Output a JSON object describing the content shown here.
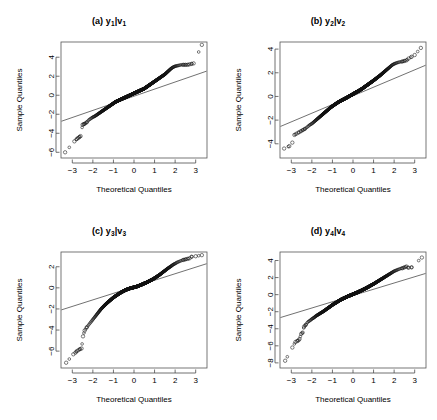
{
  "figure": {
    "width": 437,
    "height": 420,
    "background": "#ffffff",
    "layout": "2x2 grid of Q-Q (quantile-quantile) plots"
  },
  "panels": [
    {
      "id": "panel-a",
      "title": "(a) y",
      "title_sub1": "1",
      "title_mid": "|v",
      "title_sub2": "1",
      "title_full": "(a) y1|v1",
      "xlabel": "Theoretical Quantiles",
      "ylabel": "Sample Quantiles",
      "xticks": [
        -3,
        -2,
        -1,
        0,
        1,
        2,
        3
      ],
      "yticks": [
        4,
        2,
        0,
        -2,
        -4,
        -6
      ],
      "xlim": [
        -3.55,
        3.55
      ],
      "ylim": [
        -6.6,
        5.6
      ]
    },
    {
      "id": "panel-b",
      "title": "(b) y",
      "title_sub1": "2",
      "title_mid": "|v",
      "title_sub2": "2",
      "title_full": "(b) y2|v2",
      "xlabel": "Theoretical Quantiles",
      "ylabel": "Sample Quantiles",
      "xticks": [
        -3,
        -2,
        -1,
        0,
        1,
        2,
        3
      ],
      "yticks": [
        4,
        2,
        0,
        -2,
        -4
      ],
      "xlim": [
        -3.55,
        3.55
      ],
      "ylim": [
        -5.2,
        4.6
      ]
    },
    {
      "id": "panel-c",
      "title": "(c) y",
      "title_sub1": "3",
      "title_mid": "|v",
      "title_sub2": "3",
      "title_full": "(c) y3|v3",
      "xlabel": "Theoretical Quantiles",
      "ylabel": "Sample Quantiles",
      "xticks": [
        -3,
        -2,
        -1,
        0,
        1,
        2,
        3
      ],
      "yticks": [
        2,
        0,
        -2,
        -4,
        -6
      ],
      "xlim": [
        -3.55,
        3.55
      ],
      "ylim": [
        -7.6,
        3.4
      ]
    },
    {
      "id": "panel-d",
      "title": "(d) y",
      "title_sub1": "4",
      "title_mid": "|v",
      "title_sub2": "4",
      "title_full": "(d) y4|v4",
      "xlabel": "Theoretical Quantiles",
      "ylabel": "Sample Quantiles",
      "xticks": [
        -3,
        -2,
        -1,
        0,
        1,
        2,
        3
      ],
      "yticks": [
        4,
        2,
        0,
        -2,
        -4,
        -6,
        -8
      ],
      "xlim": [
        -3.55,
        3.55
      ],
      "ylim": [
        -8.6,
        5.0
      ]
    }
  ],
  "chart_data": [
    {
      "type": "scatter",
      "id": "panel-a",
      "title": "(a) y1|v1",
      "xlabel": "Theoretical Quantiles",
      "ylabel": "Sample Quantiles",
      "xlim": [
        -3.55,
        3.55
      ],
      "ylim": [
        -6.6,
        5.6
      ],
      "xticks": [
        -3,
        -2,
        -1,
        0,
        1,
        2,
        3
      ],
      "yticks": [
        4,
        2,
        0,
        -2,
        -4,
        -6
      ],
      "grid": false,
      "legend": "none",
      "annotations": [
        "reference line through 1st and 3rd quartiles"
      ],
      "reference_line": {
        "x": [
          -3.55,
          3.55
        ],
        "y": [
          -2.75,
          2.55
        ]
      },
      "series": [
        {
          "name": "sample quantiles",
          "marker": "open-circle",
          "x": [
            -3.35,
            -2.9,
            -2.78,
            -2.72,
            -2.66,
            -2.6,
            -2.5,
            -2.45,
            -2.4,
            -2.3,
            -2.2,
            -2.1,
            -2.0,
            -1.9,
            -1.8,
            -1.7,
            -1.6,
            -1.5,
            -1.4,
            -1.3,
            -1.2,
            -1.1,
            -1.0,
            -0.9,
            -0.8,
            -0.7,
            -0.6,
            -0.5,
            -0.4,
            -0.3,
            -0.2,
            -0.1,
            0.0,
            0.1,
            0.2,
            0.3,
            0.4,
            0.5,
            0.6,
            0.7,
            0.8,
            0.9,
            1.0,
            1.1,
            1.2,
            1.3,
            1.4,
            1.5,
            1.6,
            1.7,
            1.8,
            1.9,
            2.0,
            2.1,
            2.2,
            2.3,
            2.4,
            2.5,
            2.6,
            2.7,
            2.8,
            2.9,
            3.3
          ],
          "y": [
            -6.0,
            -4.85,
            -4.6,
            -4.5,
            -4.4,
            -4.3,
            -3.1,
            -3.05,
            -3.0,
            -2.85,
            -2.6,
            -2.45,
            -2.3,
            -2.2,
            -2.05,
            -1.9,
            -1.75,
            -1.6,
            -1.45,
            -1.3,
            -1.15,
            -1.0,
            -0.85,
            -0.7,
            -0.6,
            -0.5,
            -0.4,
            -0.3,
            -0.2,
            -0.1,
            0.0,
            0.1,
            0.2,
            0.3,
            0.4,
            0.5,
            0.6,
            0.7,
            0.85,
            1.0,
            1.15,
            1.3,
            1.45,
            1.6,
            1.75,
            1.9,
            2.05,
            2.2,
            2.4,
            2.6,
            2.8,
            2.95,
            3.05,
            3.1,
            3.15,
            3.2,
            3.2,
            3.2,
            3.2,
            3.25,
            3.3,
            3.35,
            5.3
          ]
        }
      ]
    },
    {
      "type": "scatter",
      "id": "panel-b",
      "title": "(b) y2|v2",
      "xlabel": "Theoretical Quantiles",
      "ylabel": "Sample Quantiles",
      "xlim": [
        -3.55,
        3.55
      ],
      "ylim": [
        -5.2,
        4.6
      ],
      "xticks": [
        -3,
        -2,
        -1,
        0,
        1,
        2,
        3
      ],
      "yticks": [
        4,
        2,
        0,
        -2,
        -4
      ],
      "grid": false,
      "legend": "none",
      "annotations": [
        "reference line through 1st and 3rd quartiles"
      ],
      "reference_line": {
        "x": [
          -3.55,
          3.55
        ],
        "y": [
          -2.55,
          2.65
        ]
      },
      "series": [
        {
          "name": "sample quantiles",
          "marker": "open-circle",
          "x": [
            -3.35,
            -3.1,
            -2.95,
            -2.85,
            -2.75,
            -2.65,
            -2.55,
            -2.45,
            -2.35,
            -2.2,
            -2.1,
            -2.0,
            -1.9,
            -1.8,
            -1.7,
            -1.6,
            -1.5,
            -1.4,
            -1.3,
            -1.2,
            -1.1,
            -1.0,
            -0.9,
            -0.8,
            -0.7,
            -0.6,
            -0.5,
            -0.4,
            -0.3,
            -0.2,
            -0.1,
            0.0,
            0.1,
            0.2,
            0.3,
            0.4,
            0.5,
            0.6,
            0.7,
            0.8,
            0.9,
            1.0,
            1.1,
            1.2,
            1.3,
            1.4,
            1.5,
            1.6,
            1.7,
            1.8,
            1.9,
            2.0,
            2.1,
            2.2,
            2.3,
            2.4,
            2.5,
            2.6,
            2.7,
            2.85,
            3.0,
            3.3
          ],
          "y": [
            -4.4,
            -4.2,
            -3.9,
            -3.25,
            -3.15,
            -3.05,
            -2.95,
            -2.85,
            -2.75,
            -2.55,
            -2.4,
            -2.3,
            -2.15,
            -2.0,
            -1.85,
            -1.7,
            -1.55,
            -1.4,
            -1.25,
            -1.1,
            -0.95,
            -0.82,
            -0.7,
            -0.58,
            -0.47,
            -0.37,
            -0.28,
            -0.19,
            -0.1,
            0.0,
            0.1,
            0.2,
            0.3,
            0.4,
            0.5,
            0.6,
            0.72,
            0.85,
            0.97,
            1.1,
            1.22,
            1.35,
            1.48,
            1.62,
            1.75,
            1.9,
            2.05,
            2.2,
            2.35,
            2.5,
            2.65,
            2.75,
            2.82,
            2.88,
            2.92,
            2.95,
            3.0,
            3.05,
            3.2,
            3.35,
            3.5,
            4.1
          ]
        }
      ]
    },
    {
      "type": "scatter",
      "id": "panel-c",
      "title": "(c) y3|v3",
      "xlabel": "Theoretical Quantiles",
      "ylabel": "Sample Quantiles",
      "xlim": [
        -3.55,
        3.55
      ],
      "ylim": [
        -7.6,
        3.4
      ],
      "xticks": [
        -3,
        -2,
        -1,
        0,
        1,
        2,
        3
      ],
      "yticks": [
        2,
        0,
        -2,
        -4,
        -6
      ],
      "grid": false,
      "legend": "none",
      "annotations": [
        "reference line through 1st and 3rd quartiles"
      ],
      "reference_line": {
        "x": [
          -3.55,
          3.55
        ],
        "y": [
          -2.1,
          2.3
        ]
      },
      "series": [
        {
          "name": "sample quantiles",
          "marker": "open-circle",
          "x": [
            -3.3,
            -2.95,
            -2.85,
            -2.78,
            -2.7,
            -2.62,
            -2.55,
            -2.48,
            -2.4,
            -2.3,
            -2.2,
            -2.1,
            -2.0,
            -1.9,
            -1.8,
            -1.7,
            -1.6,
            -1.5,
            -1.4,
            -1.3,
            -1.2,
            -1.1,
            -1.0,
            -0.9,
            -0.8,
            -0.7,
            -0.6,
            -0.5,
            -0.4,
            -0.3,
            -0.2,
            -0.1,
            0.0,
            0.1,
            0.2,
            0.3,
            0.4,
            0.5,
            0.6,
            0.7,
            0.8,
            0.9,
            1.0,
            1.1,
            1.2,
            1.3,
            1.4,
            1.5,
            1.6,
            1.7,
            1.8,
            1.9,
            2.0,
            2.1,
            2.2,
            2.3,
            2.4,
            2.5,
            2.6,
            2.7,
            2.8,
            3.0,
            3.3
          ],
          "y": [
            -7.1,
            -6.3,
            -6.15,
            -6.0,
            -5.9,
            -5.8,
            -5.75,
            -4.6,
            -4.05,
            -3.75,
            -3.5,
            -3.25,
            -3.0,
            -2.75,
            -2.5,
            -2.25,
            -2.0,
            -1.8,
            -1.6,
            -1.42,
            -1.25,
            -1.08,
            -0.92,
            -0.78,
            -0.65,
            -0.52,
            -0.4,
            -0.3,
            -0.2,
            -0.12,
            -0.05,
            0.0,
            0.05,
            0.1,
            0.17,
            0.25,
            0.33,
            0.42,
            0.5,
            0.6,
            0.7,
            0.8,
            0.92,
            1.05,
            1.18,
            1.32,
            1.48,
            1.62,
            1.78,
            1.92,
            2.05,
            2.2,
            2.3,
            2.42,
            2.5,
            2.58,
            2.65,
            2.7,
            2.75,
            2.8,
            2.95,
            3.0,
            3.1
          ]
        }
      ]
    },
    {
      "type": "scatter",
      "id": "panel-d",
      "title": "(d) y4|v4",
      "xlabel": "Theoretical Quantiles",
      "ylabel": "Sample Quantiles",
      "xlim": [
        -3.55,
        3.55
      ],
      "ylim": [
        -8.6,
        5.0
      ],
      "xticks": [
        -3,
        -2,
        -1,
        0,
        1,
        2,
        3
      ],
      "yticks": [
        4,
        2,
        0,
        -2,
        -4,
        -6,
        -8
      ],
      "grid": false,
      "legend": "none",
      "annotations": [
        "reference line through 1st and 3rd quartiles"
      ],
      "reference_line": {
        "x": [
          -3.55,
          3.55
        ],
        "y": [
          -2.7,
          2.5
        ]
      },
      "series": [
        {
          "name": "sample quantiles",
          "marker": "open-circle",
          "x": [
            -3.3,
            -2.95,
            -2.8,
            -2.72,
            -2.65,
            -2.6,
            -2.52,
            -2.45,
            -2.38,
            -2.3,
            -2.2,
            -2.1,
            -2.0,
            -1.9,
            -1.8,
            -1.7,
            -1.6,
            -1.5,
            -1.4,
            -1.3,
            -1.2,
            -1.1,
            -1.0,
            -0.9,
            -0.8,
            -0.7,
            -0.6,
            -0.5,
            -0.4,
            -0.3,
            -0.2,
            -0.1,
            0.0,
            0.1,
            0.2,
            0.3,
            0.4,
            0.5,
            0.6,
            0.7,
            0.8,
            0.9,
            1.0,
            1.1,
            1.2,
            1.3,
            1.4,
            1.5,
            1.6,
            1.7,
            1.8,
            1.9,
            2.0,
            2.1,
            2.2,
            2.3,
            2.4,
            2.5,
            2.6,
            2.7,
            2.85,
            3.35
          ],
          "y": [
            -7.75,
            -6.2,
            -5.55,
            -5.45,
            -5.35,
            -5.2,
            -4.6,
            -4.45,
            -3.75,
            -3.55,
            -3.2,
            -3.05,
            -2.85,
            -2.7,
            -2.5,
            -2.35,
            -2.2,
            -2.05,
            -1.9,
            -1.72,
            -1.55,
            -1.38,
            -1.2,
            -1.05,
            -0.9,
            -0.75,
            -0.6,
            -0.48,
            -0.37,
            -0.25,
            -0.15,
            -0.05,
            0.05,
            0.15,
            0.25,
            0.37,
            0.48,
            0.6,
            0.72,
            0.85,
            0.98,
            1.12,
            1.25,
            1.4,
            1.55,
            1.7,
            1.85,
            2.0,
            2.15,
            2.3,
            2.45,
            2.6,
            2.75,
            2.85,
            2.95,
            3.05,
            3.1,
            3.2,
            3.3,
            3.15,
            3.2,
            4.35
          ]
        }
      ]
    }
  ]
}
